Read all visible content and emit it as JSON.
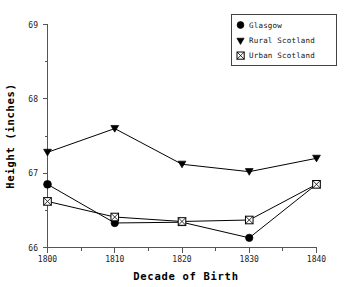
{
  "chart_data": {
    "type": "line",
    "title": "",
    "subtitle": "",
    "xlabel": "Decade of Birth",
    "ylabel": "Height (inches)",
    "x": [
      1800,
      1810,
      1820,
      1830,
      1840
    ],
    "xtick_labels": [
      "1800",
      "1810",
      "1820",
      "1830",
      "1840"
    ],
    "ytick_labels": [
      "66",
      "67",
      "68",
      "69"
    ],
    "ytick_values": [
      66,
      67,
      68,
      69
    ],
    "xlim": [
      1800,
      1840
    ],
    "ylim": [
      66,
      69
    ],
    "grid": false,
    "minor_ticks": true,
    "legend_position": "top-right",
    "series": [
      {
        "name": "Glasgow",
        "marker": "filled-circle-square",
        "values": [
          66.85,
          66.33,
          66.34,
          66.13,
          66.85
        ]
      },
      {
        "name": "Rural Scotland",
        "marker": "filled-down-triangle",
        "values": [
          67.28,
          67.6,
          67.12,
          67.02,
          67.2
        ]
      },
      {
        "name": "Urban Scotland",
        "marker": "crossed-square",
        "values": [
          66.62,
          66.41,
          66.35,
          66.37,
          66.85
        ]
      }
    ]
  },
  "legend": {
    "entries": [
      {
        "label": "Glasgow",
        "marker": "circle-marker-icon"
      },
      {
        "label": "Rural Scotland",
        "marker": "triangle-marker-icon"
      },
      {
        "label": "Urban Scotland",
        "marker": "crossed-square-marker-icon"
      }
    ]
  },
  "axes": {
    "x_title": "Decade of Birth",
    "y_title": "Height (inches)"
  },
  "colors": {
    "ink": "#000000",
    "axis": "#555555",
    "background": "#ffffff"
  }
}
